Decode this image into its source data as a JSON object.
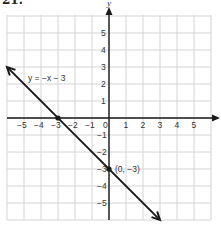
{
  "problem": {
    "number": "21."
  },
  "chart_data": {
    "type": "line",
    "title": "",
    "xlabel": "x",
    "ylabel": "y",
    "xlim": [
      -6,
      6
    ],
    "ylim": [
      -6,
      6
    ],
    "grid": true,
    "x_ticks": [
      -5,
      -4,
      -3,
      -2,
      -1,
      0,
      1,
      2,
      3,
      4,
      5
    ],
    "y_ticks": [
      5,
      4,
      3,
      2,
      1,
      -1,
      -2,
      -3,
      -4,
      -5
    ],
    "series": [
      {
        "name": "y = −x − 3",
        "equation": "y = -x - 3",
        "slope": -1,
        "intercept": -3,
        "x": [
          -6,
          3
        ],
        "y": [
          3,
          -6
        ],
        "arrows": "both"
      }
    ],
    "points": [
      {
        "x": -3,
        "y": 0,
        "label": ""
      },
      {
        "x": 0,
        "y": -3,
        "label": "(0, −3)"
      }
    ],
    "annotations": [
      {
        "text": "y = −x − 3",
        "near": [
          -4,
          2.3
        ]
      },
      {
        "text": "(0, −3)",
        "near": [
          0.5,
          -3
        ]
      }
    ]
  },
  "labels": {
    "x_axis": "x",
    "y_axis": "y",
    "equation": "y = −x − 3",
    "point": "(0, −3)",
    "x_ticks": [
      "−5",
      "−4",
      "−3",
      "−2",
      "−1",
      "0",
      "1",
      "2",
      "3",
      "4",
      "5"
    ],
    "y_ticks_pos": [
      "5",
      "4",
      "3",
      "2",
      "1"
    ],
    "y_ticks_neg": [
      "−1",
      "−2",
      "−3",
      "−4",
      "−5"
    ]
  },
  "colors": {
    "grid": "#d4d4d4",
    "axis": "#1a1a1a",
    "line": "#1a1a1a",
    "text": "#333333"
  }
}
